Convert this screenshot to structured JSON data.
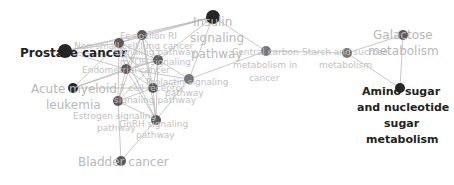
{
  "diagram": {
    "type": "network",
    "colors": {
      "node_dark": "#262626",
      "node_mid": "#5a5a5a",
      "node_light": "#777777",
      "edge": "#9a9a9a",
      "label_dark": "#222222",
      "label_light": "#b8b8b8"
    },
    "nodes": [
      {
        "id": "prostate",
        "label": "Prostate cancer",
        "x": 65,
        "y": 51,
        "r": 7,
        "shade": "dark"
      },
      {
        "id": "insulin",
        "label": "Insulin signaling pathway",
        "x": 213,
        "y": 17,
        "r": 7,
        "shade": "dark"
      },
      {
        "id": "aml",
        "label": "Acute myeloid leukemia",
        "x": 73,
        "y": 88,
        "r": 5,
        "shade": "dark"
      },
      {
        "id": "n1",
        "label": "Non-small cell lung cancer",
        "x": 119,
        "y": 43,
        "r": 5,
        "shade": "mid"
      },
      {
        "id": "n2",
        "label": "Fc epsilon RI signaling pathway",
        "x": 142,
        "y": 35,
        "r": 5,
        "shade": "mid"
      },
      {
        "id": "n3",
        "label": "mTOR signaling pathway",
        "x": 158,
        "y": 60,
        "r": 5,
        "shade": "mid"
      },
      {
        "id": "n4",
        "label": "Endometrial cancer",
        "x": 126,
        "y": 69,
        "r": 5,
        "shade": "mid"
      },
      {
        "id": "n5",
        "label": "Prolactin signaling pathway",
        "x": 153,
        "y": 88,
        "r": 5,
        "shade": "mid"
      },
      {
        "id": "n6",
        "label": "Prolactin signaling pathway",
        "x": 189,
        "y": 79,
        "r": 5,
        "shade": "light"
      },
      {
        "id": "tcell",
        "label": "T cell receptor signaling pathway",
        "x": 118,
        "y": 101,
        "r": 5,
        "shade": "mid"
      },
      {
        "id": "gnrh",
        "label": "GnRH signaling pathway",
        "x": 156,
        "y": 120,
        "r": 5,
        "shade": "mid"
      },
      {
        "id": "bladder",
        "label": "Bladder cancer",
        "x": 121,
        "y": 161,
        "r": 5,
        "shade": "mid"
      },
      {
        "id": "central",
        "label": "Central carbon metabolism in cancer",
        "x": 266,
        "y": 51,
        "r": 5,
        "shade": "light"
      },
      {
        "id": "starch",
        "label": "Starch and sucrose metabolism",
        "x": 347,
        "y": 53,
        "r": 5,
        "shade": "light"
      },
      {
        "id": "galactose",
        "label": "Galactose metabolism",
        "x": 403,
        "y": 35,
        "r": 5,
        "shade": "mid"
      },
      {
        "id": "amino",
        "label": "Amino sugar and nucleotide sugar metabolism",
        "x": 400,
        "y": 88,
        "r": 5,
        "shade": "dark"
      }
    ],
    "edges": [
      [
        "prostate",
        "n1"
      ],
      [
        "prostate",
        "n2"
      ],
      [
        "prostate",
        "n3"
      ],
      [
        "prostate",
        "n4"
      ],
      [
        "prostate",
        "insulin"
      ],
      [
        "insulin",
        "n2"
      ],
      [
        "insulin",
        "n1"
      ],
      [
        "insulin",
        "n3"
      ],
      [
        "insulin",
        "central"
      ],
      [
        "insulin",
        "n6"
      ],
      [
        "aml",
        "n1"
      ],
      [
        "aml",
        "n4"
      ],
      [
        "aml",
        "n3"
      ],
      [
        "aml",
        "n5"
      ],
      [
        "n1",
        "n2"
      ],
      [
        "n1",
        "n3"
      ],
      [
        "n1",
        "n4"
      ],
      [
        "n1",
        "n5"
      ],
      [
        "n1",
        "tcell"
      ],
      [
        "n1",
        "gnrh"
      ],
      [
        "n2",
        "n3"
      ],
      [
        "n2",
        "n4"
      ],
      [
        "n2",
        "n5"
      ],
      [
        "n2",
        "tcell"
      ],
      [
        "n2",
        "gnrh"
      ],
      [
        "n3",
        "n4"
      ],
      [
        "n3",
        "n5"
      ],
      [
        "n3",
        "n6"
      ],
      [
        "n3",
        "gnrh"
      ],
      [
        "n3",
        "tcell"
      ],
      [
        "n4",
        "n5"
      ],
      [
        "n4",
        "tcell"
      ],
      [
        "n4",
        "gnrh"
      ],
      [
        "n4",
        "n6"
      ],
      [
        "n5",
        "n6"
      ],
      [
        "n5",
        "tcell"
      ],
      [
        "n5",
        "gnrh"
      ],
      [
        "n6",
        "central"
      ],
      [
        "n6",
        "gnrh"
      ],
      [
        "tcell",
        "gnrh"
      ],
      [
        "tcell",
        "bladder"
      ],
      [
        "gnrh",
        "bladder"
      ],
      [
        "central",
        "starch"
      ],
      [
        "starch",
        "galactose"
      ],
      [
        "starch",
        "amino"
      ],
      [
        "galactose",
        "amino"
      ]
    ],
    "labels": [
      {
        "text": "Prostate cancer",
        "x": 20,
        "y": 59,
        "size": 12,
        "style": "dark"
      },
      {
        "text": "Insulin",
        "x": 193,
        "y": 28,
        "size": 12,
        "style": "light"
      },
      {
        "text": "signaling",
        "x": 190,
        "y": 44,
        "size": 12,
        "style": "light"
      },
      {
        "text": "pathway",
        "x": 191,
        "y": 60,
        "size": 12,
        "style": "light"
      },
      {
        "text": "Acute myeloid",
        "x": 31,
        "y": 95,
        "size": 12,
        "style": "light"
      },
      {
        "text": "leukemia",
        "x": 46,
        "y": 111,
        "size": 12,
        "style": "light"
      },
      {
        "text": "Non-small cell lung cancer",
        "x": 74,
        "y": 50,
        "size": 9,
        "style": "tiny"
      },
      {
        "text": "Fc epsilon RI",
        "x": 120,
        "y": 40,
        "size": 9,
        "style": "tiny"
      },
      {
        "text": "signaling pathway",
        "x": 114,
        "y": 56,
        "size": 9,
        "style": "tiny"
      },
      {
        "text": "mTOR signaling",
        "x": 120,
        "y": 66,
        "size": 9,
        "style": "tiny"
      },
      {
        "text": "Endometrial cancer",
        "x": 82,
        "y": 74,
        "size": 9,
        "style": "tiny"
      },
      {
        "text": "Prolactin signaling",
        "x": 146,
        "y": 86,
        "size": 9,
        "style": "tiny"
      },
      {
        "text": "pathway",
        "x": 165,
        "y": 97,
        "size": 9,
        "style": "tiny"
      },
      {
        "text": "T cell receptor",
        "x": 120,
        "y": 92,
        "size": 9,
        "style": "tiny"
      },
      {
        "text": "signaling pathway",
        "x": 114,
        "y": 104,
        "size": 9,
        "style": "tiny"
      },
      {
        "text": "Estrogen signaling",
        "x": 73,
        "y": 120,
        "size": 9,
        "style": "tiny"
      },
      {
        "text": "pathway",
        "x": 97,
        "y": 132,
        "size": 9,
        "style": "tiny"
      },
      {
        "text": "GnRH signaling",
        "x": 119,
        "y": 128,
        "size": 9,
        "style": "tiny"
      },
      {
        "text": "pathway",
        "x": 136,
        "y": 139,
        "size": 9,
        "style": "tiny"
      },
      {
        "text": "Bladder cancer",
        "x": 78,
        "y": 168,
        "size": 12,
        "style": "light"
      },
      {
        "text": "Central carbon",
        "x": 232,
        "y": 56,
        "size": 9,
        "style": "tiny"
      },
      {
        "text": "metabolism in",
        "x": 233,
        "y": 69,
        "size": 9,
        "style": "tiny"
      },
      {
        "text": "cancer",
        "x": 249,
        "y": 82,
        "size": 9,
        "style": "tiny"
      },
      {
        "text": "Starch and sucrose",
        "x": 302,
        "y": 56,
        "size": 9,
        "style": "tiny"
      },
      {
        "text": "metabolism",
        "x": 319,
        "y": 69,
        "size": 9,
        "style": "tiny"
      },
      {
        "text": "Galactose",
        "x": 373,
        "y": 41,
        "size": 12,
        "style": "light"
      },
      {
        "text": "metabolism",
        "x": 368,
        "y": 57,
        "size": 12,
        "style": "light"
      },
      {
        "text": "Amino sugar",
        "x": 362,
        "y": 97,
        "size": 11,
        "style": "dark"
      },
      {
        "text": "and nucleotide",
        "x": 357,
        "y": 113,
        "size": 11,
        "style": "dark"
      },
      {
        "text": "sugar",
        "x": 384,
        "y": 129,
        "size": 11,
        "style": "dark"
      },
      {
        "text": "metabolism",
        "x": 366,
        "y": 145,
        "size": 11,
        "style": "dark"
      }
    ]
  }
}
